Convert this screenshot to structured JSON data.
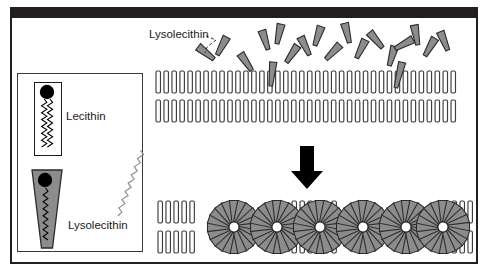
{
  "figure": {
    "title_text": "",
    "background": "#ffffff",
    "frame_color": "#231f20",
    "ink_color": "#1a1a1a",
    "wedge_fill": "#8c8c8c",
    "wedge_stroke": "#2b2b2b",
    "lipid_fill": "#ffffff",
    "lipid_stroke": "#3d3d3d",
    "head_color": "#000000"
  },
  "legend": {
    "box_label": "",
    "items": [
      {
        "key": "lecithin",
        "label": "Lecithin",
        "shape": "rectangle-two-tails",
        "fill": "#ffffff",
        "tails": 2
      },
      {
        "key": "lysolecithin",
        "label": "Lysolecithin",
        "shape": "wedge-one-tail",
        "fill": "#8c8c8c",
        "tails": 1
      }
    ]
  },
  "annotations": [
    {
      "key": "lysolecithin-callout",
      "label": "Lysolecithin",
      "leader": "dashed"
    }
  ],
  "arrow": {
    "direction": "down",
    "color": "#000000"
  },
  "chart_data": {
    "type": "diagram",
    "panels": [
      {
        "key": "before",
        "caption": "Lysolecithin molecules accumulate above an intact lecithin bilayer",
        "bilayer_rows": 2,
        "lipid_count_per_row": 38,
        "free_lysolecithin_count": 17,
        "inserted_lysolecithin_count": 2
      },
      {
        "key": "after",
        "caption": "Bilayer fragments into lysolecithin-rich micelles",
        "micelle_count": 6,
        "wedges_per_micelle": 20,
        "residual_bilayer_rows": 2
      }
    ]
  }
}
